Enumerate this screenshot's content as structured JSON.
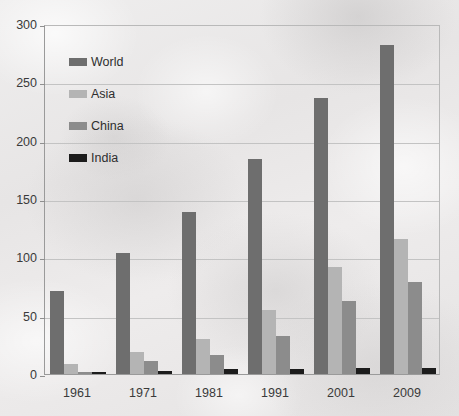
{
  "chart_data": {
    "type": "bar",
    "title": "",
    "subtitle": "",
    "xlabel": "",
    "ylabel": "",
    "categories": [
      "1961",
      "1971",
      "1981",
      "1991",
      "2001",
      "2009"
    ],
    "series": [
      {
        "name": "World",
        "color": "#6e6e6e",
        "values": [
          71,
          104,
          139,
          184,
          237,
          282
        ]
      },
      {
        "name": "Asia",
        "color": "#b4b4b4",
        "values": [
          9,
          19,
          30,
          55,
          92,
          116
        ]
      },
      {
        "name": "China",
        "color": "#8c8c8c",
        "values": [
          2,
          11,
          16,
          33,
          63,
          79
        ]
      },
      {
        "name": "India",
        "color": "#1c1c1c",
        "values": [
          1,
          3,
          4,
          4,
          5,
          5
        ]
      }
    ],
    "ylim": [
      0,
      300
    ],
    "yticks": [
      0,
      50,
      100,
      150,
      200,
      250,
      300
    ],
    "ytick_labels": [
      "0",
      "50",
      "100",
      "150",
      "200",
      "250",
      "300"
    ],
    "grid": true,
    "grid_axis": "y",
    "legend_position": "upper-left-inside",
    "legend_entries": [
      "World",
      "Asia",
      "China",
      "India"
    ],
    "background_color": "#eceaea",
    "axis_color": "#9a9a9a",
    "gridline_color": "#c3c3c3",
    "text_color": "#3a3a3a"
  }
}
